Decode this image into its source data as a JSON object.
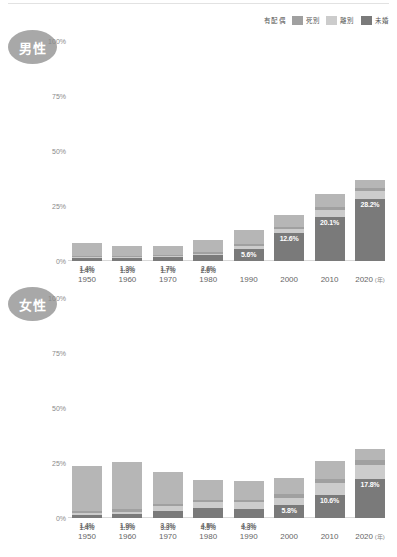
{
  "legend": {
    "items": [
      {
        "label": "有配偶",
        "color": "#b6b6b6",
        "swatch": false
      },
      {
        "label": "死別",
        "color": "#a0a0a0",
        "swatch": true
      },
      {
        "label": "離別",
        "color": "#cccccc",
        "swatch": true
      },
      {
        "label": "未婚",
        "color": "#7a7a7a",
        "swatch": true
      }
    ]
  },
  "axis": {
    "yticks": [
      "100%",
      "75%",
      "50%",
      "25%",
      "0%"
    ],
    "ymax": 100,
    "xlabels": [
      "1950",
      "1960",
      "1970",
      "1980",
      "1990",
      "2000",
      "2010",
      "2020"
    ],
    "xunit": "(年)"
  },
  "panels": [
    {
      "id": "male",
      "badge": "男性"
    },
    {
      "id": "female",
      "badge": "女性"
    }
  ],
  "chart_data": {
    "type": "bar",
    "title": "",
    "xlabel": "年",
    "ylabel": "%",
    "ylim": [
      0,
      100
    ],
    "grid": false,
    "legend_position": "top-right",
    "categories": [
      "1950",
      "1960",
      "1970",
      "1980",
      "1990",
      "2000",
      "2010",
      "2020"
    ],
    "stack_order": [
      "未婚",
      "離別",
      "死別",
      "有配偶"
    ],
    "panels": [
      {
        "name": "男性",
        "labels": [
          "1.4%",
          "1.3%",
          "1.7%",
          "2.6%",
          "5.6%",
          "12.6%",
          "20.1%",
          "28.2%"
        ],
        "series": [
          {
            "name": "未婚",
            "color": "#7a7a7a",
            "values": [
              1.4,
              1.3,
              1.7,
              2.6,
              5.6,
              12.6,
              20.1,
              28.2
            ]
          },
          {
            "name": "離別",
            "color": "#cccccc",
            "values": [
              0.5,
              0.5,
              0.6,
              0.8,
              1.2,
              2.0,
              3.0,
              3.6
            ]
          },
          {
            "name": "死別",
            "color": "#a0a0a0",
            "values": [
              0.6,
              0.6,
              0.6,
              0.7,
              0.8,
              1.0,
              1.3,
              1.6
            ]
          },
          {
            "name": "有配偶",
            "color": "#b6b6b6",
            "values": [
              5.5,
              4.6,
              4.1,
              5.4,
              6.4,
              5.4,
              6.1,
              3.6
            ]
          }
        ],
        "totals": [
          8.0,
          7.0,
          7.0,
          9.5,
          14.0,
          21.0,
          30.5,
          37.0
        ]
      },
      {
        "name": "女性",
        "labels": [
          "1.4%",
          "1.9%",
          "3.3%",
          "4.5%",
          "4.3%",
          "5.8%",
          "10.6%",
          "17.8%"
        ],
        "series": [
          {
            "name": "未婚",
            "color": "#7a7a7a",
            "values": [
              1.4,
              1.9,
              3.3,
              4.5,
              4.3,
              5.8,
              10.6,
              17.8
            ]
          },
          {
            "name": "離別",
            "color": "#cccccc",
            "values": [
              0.8,
              1.0,
              2.0,
              2.6,
              2.8,
              3.4,
              5.2,
              6.4
            ]
          },
          {
            "name": "死別",
            "color": "#a0a0a0",
            "values": [
              0.9,
              1.0,
              1.2,
              1.3,
              1.3,
              1.5,
              1.8,
              2.0
            ]
          },
          {
            "name": "有配偶",
            "color": "#b6b6b6",
            "values": [
              20.4,
              21.6,
              14.5,
              9.1,
              8.6,
              7.3,
              8.4,
              5.3
            ]
          }
        ],
        "totals": [
          23.5,
          25.5,
          21.0,
          17.5,
          17.0,
          18.0,
          26.0,
          31.5
        ]
      }
    ]
  }
}
